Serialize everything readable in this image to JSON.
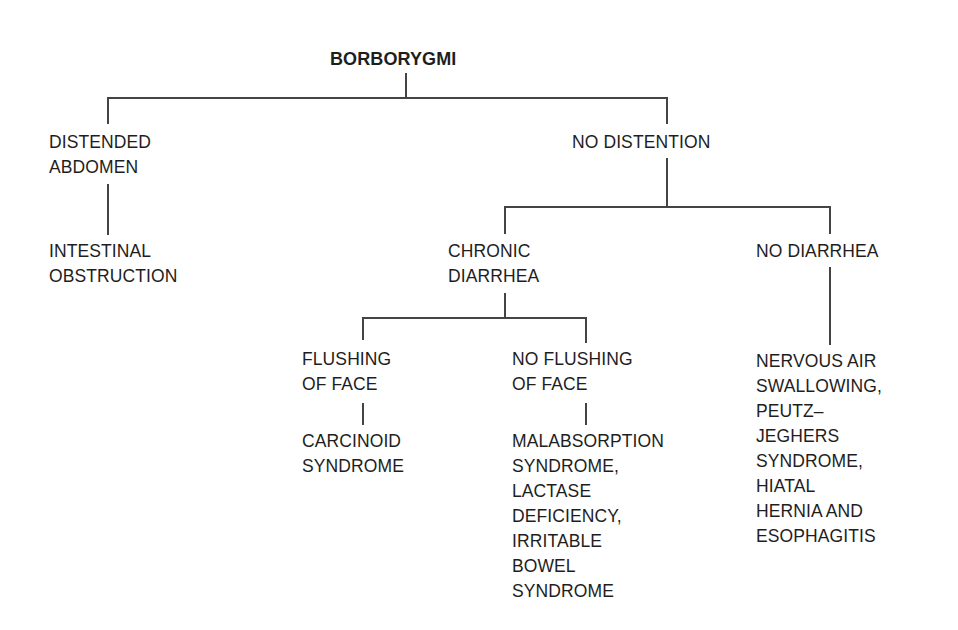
{
  "diagram": {
    "title": "BORBORYGMI",
    "type": "decision-tree",
    "line_color": "#444444",
    "text_color": "#1e1e1e",
    "nodes": {
      "root": {
        "lines": [
          "BORBORYGMI"
        ]
      },
      "distended": {
        "lines": [
          "DISTENDED",
          "ABDOMEN"
        ]
      },
      "obstruction": {
        "lines": [
          "INTESTINAL",
          "OBSTRUCTION"
        ]
      },
      "no_distention": {
        "lines": [
          "NO DISTENTION"
        ]
      },
      "chronic_diarrhea": {
        "lines": [
          "CHRONIC",
          "DIARRHEA"
        ]
      },
      "no_diarrhea": {
        "lines": [
          "NO DIARRHEA"
        ]
      },
      "flushing": {
        "lines": [
          "FLUSHING",
          "OF FACE"
        ]
      },
      "no_flushing": {
        "lines": [
          "NO FLUSHING",
          "OF FACE"
        ]
      },
      "carcinoid": {
        "lines": [
          "CARCINOID",
          "SYNDROME"
        ]
      },
      "malabsorption": {
        "lines": [
          "MALABSORPTION",
          "SYNDROME,",
          "LACTASE",
          "DEFICIENCY,",
          "IRRITABLE",
          "BOWEL",
          "SYNDROME"
        ]
      },
      "nervous_air": {
        "lines": [
          "NERVOUS AIR",
          "SWALLOWING,",
          "PEUTZ–",
          "JEGHERS",
          "SYNDROME,",
          "HIATAL",
          "HERNIA AND",
          "ESOPHAGITIS"
        ]
      }
    },
    "edges": [
      [
        "root",
        "distended"
      ],
      [
        "root",
        "no_distention"
      ],
      [
        "distended",
        "obstruction"
      ],
      [
        "no_distention",
        "chronic_diarrhea"
      ],
      [
        "no_distention",
        "no_diarrhea"
      ],
      [
        "chronic_diarrhea",
        "flushing"
      ],
      [
        "chronic_diarrhea",
        "no_flushing"
      ],
      [
        "flushing",
        "carcinoid"
      ],
      [
        "no_flushing",
        "malabsorption"
      ],
      [
        "no_diarrhea",
        "nervous_air"
      ]
    ]
  }
}
